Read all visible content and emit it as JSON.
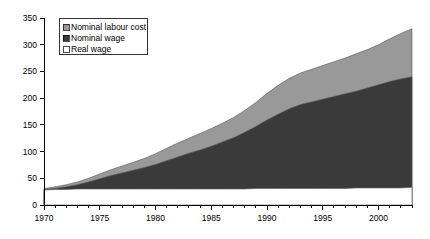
{
  "chart_data": {
    "type": "area",
    "title": "",
    "subtitle": "",
    "xlabel": "",
    "ylabel": "",
    "stacked": false,
    "grid": false,
    "legend_position": "top-left",
    "xlim": [
      1970,
      2003
    ],
    "ylim": [
      0,
      350
    ],
    "ytick_values": [
      0,
      50,
      100,
      150,
      200,
      250,
      300,
      350
    ],
    "ytick_labels": [
      "0",
      "50",
      "100",
      "150",
      "200",
      "250",
      "300",
      "350"
    ],
    "xtick_values": [
      1970,
      1975,
      1980,
      1985,
      1990,
      1995,
      2000
    ],
    "xtick_labels": [
      "1970",
      "1975",
      "1980",
      "1985",
      "1990",
      "1995",
      "2000"
    ],
    "x_minor_step": 1,
    "x": [
      1970,
      1971,
      1972,
      1973,
      1974,
      1975,
      1976,
      1977,
      1978,
      1979,
      1980,
      1981,
      1982,
      1983,
      1984,
      1985,
      1986,
      1987,
      1988,
      1989,
      1990,
      1991,
      1992,
      1993,
      1994,
      1995,
      1996,
      1997,
      1998,
      1999,
      2000,
      2001,
      2002,
      2003
    ],
    "series": [
      {
        "name": "Nominal labour cost",
        "color": "#999999",
        "values": [
          31,
          34,
          38,
          43,
          50,
          58,
          66,
          73,
          80,
          87,
          96,
          106,
          116,
          125,
          134,
          143,
          153,
          164,
          177,
          192,
          209,
          224,
          237,
          247,
          254,
          261,
          268,
          275,
          283,
          291,
          300,
          311,
          321,
          330
        ]
      },
      {
        "name": "Nominal wage",
        "color": "#3a3a3a",
        "values": [
          29,
          31,
          34,
          38,
          43,
          49,
          55,
          60,
          65,
          70,
          76,
          83,
          90,
          97,
          103,
          110,
          118,
          126,
          136,
          147,
          159,
          170,
          180,
          188,
          193,
          198,
          203,
          208,
          213,
          219,
          225,
          231,
          236,
          240
        ]
      },
      {
        "name": "Real wage",
        "color": "#ffffff",
        "values": [
          28,
          29,
          29,
          30,
          30,
          30,
          30,
          30,
          30,
          30,
          30,
          30,
          30,
          30,
          30,
          30,
          30,
          30,
          30,
          31,
          31,
          31,
          31,
          31,
          31,
          31,
          31,
          31,
          32,
          32,
          32,
          32,
          32,
          33
        ]
      }
    ],
    "legend": [
      {
        "label": "Nominal labour cost",
        "color": "#999999"
      },
      {
        "label": "Nominal wage",
        "color": "#3a3a3a"
      },
      {
        "label": "Real wage",
        "color": "#ffffff"
      }
    ]
  }
}
